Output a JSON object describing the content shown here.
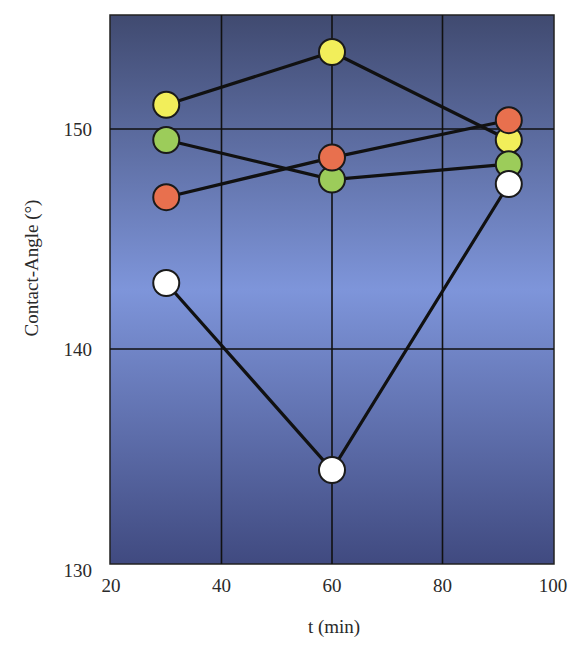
{
  "chart_data": {
    "type": "line",
    "title": "",
    "xlabel": "t (min)",
    "ylabel": "Contact-Angle (°)",
    "xlim": [
      20,
      100
    ],
    "ylim": [
      130,
      155
    ],
    "x_ticks": [
      20,
      40,
      60,
      80,
      100
    ],
    "y_ticks": [
      130,
      140,
      150
    ],
    "grid": true,
    "legend": null,
    "x": [
      30,
      60,
      92
    ],
    "series": [
      {
        "name": "yellow",
        "color": "#f2ee5a",
        "values": [
          151.1,
          153.5,
          149.5
        ]
      },
      {
        "name": "green",
        "color": "#9ccc5a",
        "values": [
          149.5,
          147.7,
          148.4
        ]
      },
      {
        "name": "orange",
        "color": "#e8704e",
        "values": [
          146.9,
          148.7,
          150.4
        ]
      },
      {
        "name": "white",
        "color": "#ffffff",
        "values": [
          143.0,
          134.5,
          147.5
        ]
      }
    ]
  },
  "labels": {
    "xlabel": "t (min)",
    "ylabel": "Contact-Angle (°)"
  },
  "style": {
    "bg_top": "#404a70",
    "bg_mid": "#7e95da",
    "bg_bottom": "#404a80",
    "line_color": "#111111",
    "grid_color": "#111111"
  }
}
